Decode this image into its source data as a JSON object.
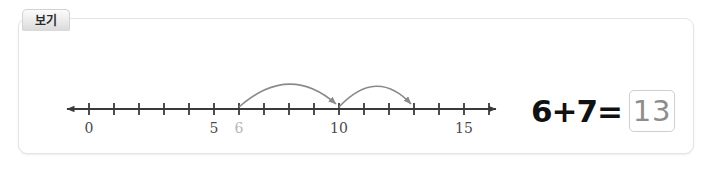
{
  "card": {
    "tab_label": "보기"
  },
  "number_line": {
    "axis_color": "#3a3a3a",
    "arc_color": "#8a8a8a",
    "label_color": "#4a4a4a",
    "annotation_color": "#b6b6b6",
    "min": 0,
    "max": 17,
    "tick_step": 1,
    "labels": [
      {
        "value": 0,
        "text": "0",
        "style": "normal"
      },
      {
        "value": 5,
        "text": "5",
        "style": "normal"
      },
      {
        "value": 6,
        "text": "6",
        "style": "annotation"
      },
      {
        "value": 10,
        "text": "10",
        "style": "normal"
      },
      {
        "value": 15,
        "text": "15",
        "style": "normal"
      }
    ],
    "jumps": [
      {
        "from": 6,
        "to": 10,
        "label": "jump-arc-6-to-10"
      },
      {
        "from": 10,
        "to": 13,
        "label": "jump-arc-10-to-13"
      }
    ]
  },
  "equation": {
    "expression": "6+7=",
    "answer": "13"
  }
}
